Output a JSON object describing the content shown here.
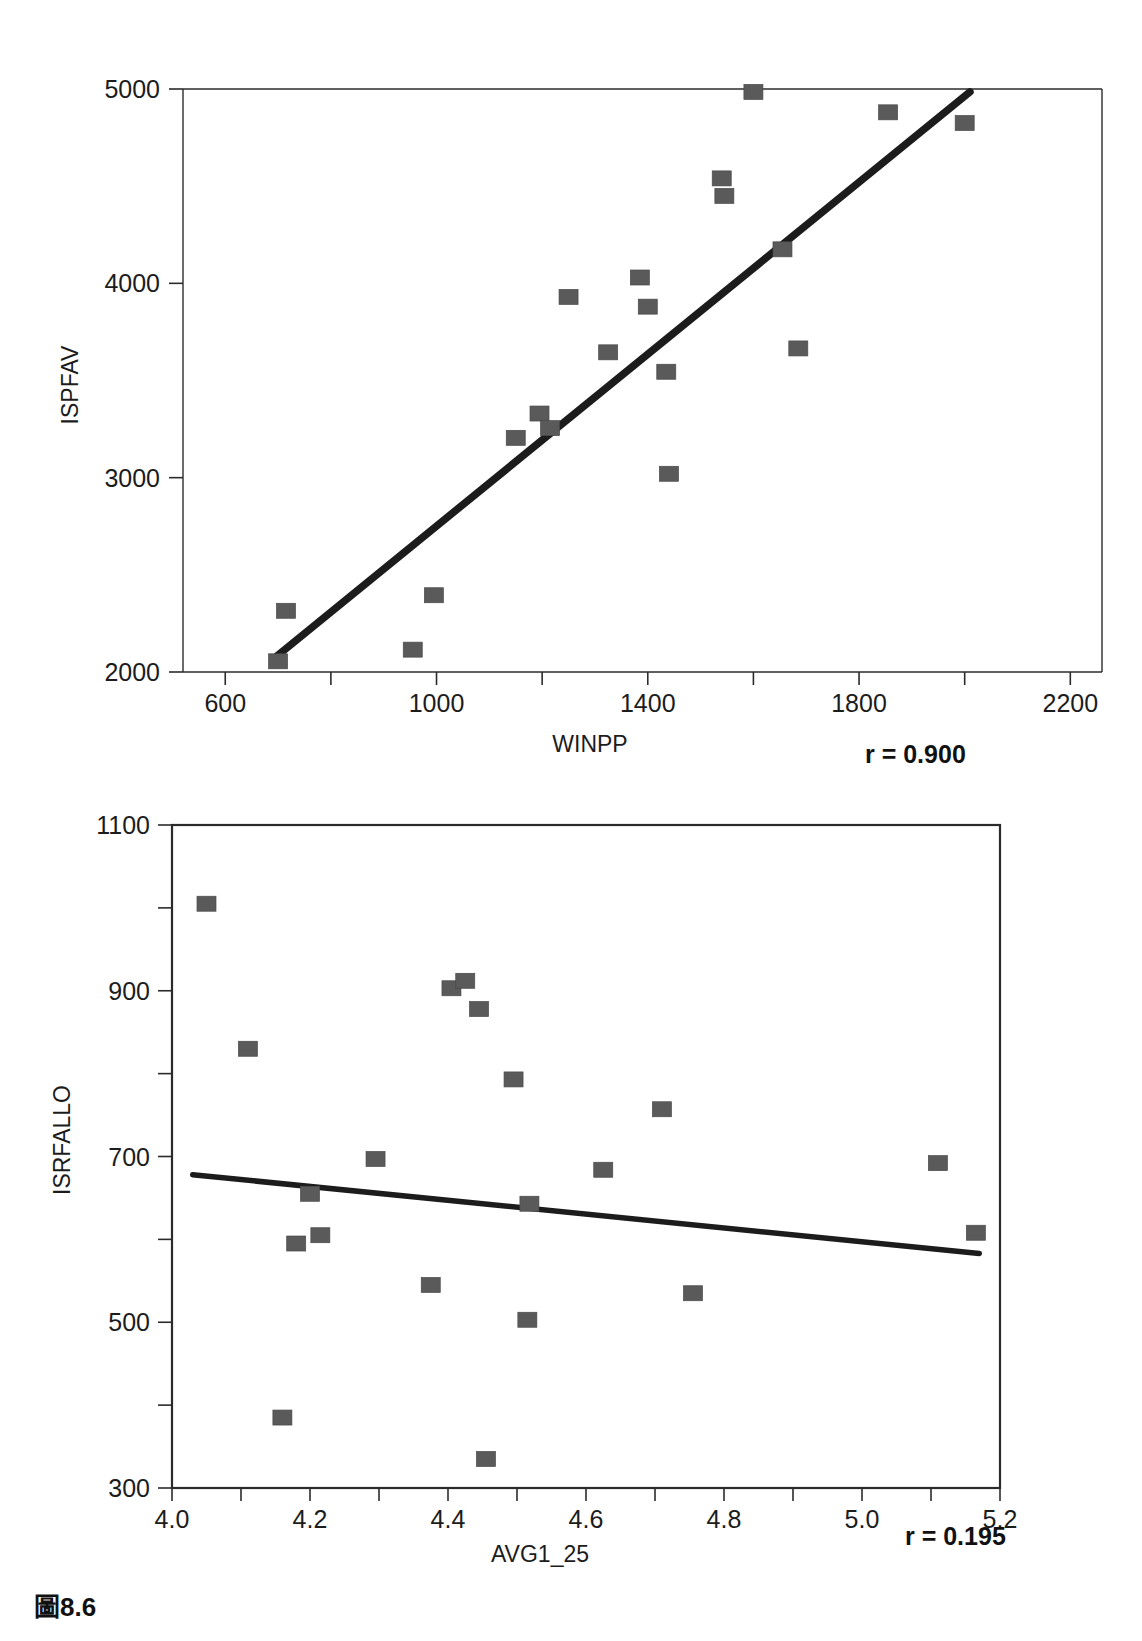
{
  "caption": "圖8.6",
  "chart_data": [
    {
      "id": "chart-1",
      "type": "scatter",
      "title": "",
      "xlabel": "WINPP",
      "ylabel": "ISPFAV",
      "xlim": [
        520,
        2260
      ],
      "ylim": [
        2000,
        5000
      ],
      "xticks": [
        600,
        1000,
        1400,
        1800,
        2200
      ],
      "xtick_labels": [
        "600",
        "1000",
        "1400",
        "1800",
        "2200"
      ],
      "xminor": [
        800,
        1200,
        1600,
        2000
      ],
      "yticks": [
        2000,
        3000,
        4000,
        5000
      ],
      "ytick_labels": [
        "2000",
        "3000",
        "4000",
        "5000"
      ],
      "grid": false,
      "annotation": "r = 0.900",
      "correlation": 0.9,
      "points": [
        {
          "x": 715,
          "y": 2315
        },
        {
          "x": 700,
          "y": 2055
        },
        {
          "x": 955,
          "y": 2115
        },
        {
          "x": 995,
          "y": 2395
        },
        {
          "x": 1150,
          "y": 3205
        },
        {
          "x": 1195,
          "y": 3330
        },
        {
          "x": 1215,
          "y": 3255
        },
        {
          "x": 1250,
          "y": 3930
        },
        {
          "x": 1325,
          "y": 3645
        },
        {
          "x": 1385,
          "y": 4030
        },
        {
          "x": 1400,
          "y": 3880
        },
        {
          "x": 1435,
          "y": 3545
        },
        {
          "x": 1440,
          "y": 3020
        },
        {
          "x": 1540,
          "y": 4540
        },
        {
          "x": 1545,
          "y": 4450
        },
        {
          "x": 1600,
          "y": 4985
        },
        {
          "x": 1655,
          "y": 4175
        },
        {
          "x": 1685,
          "y": 3665
        },
        {
          "x": 1855,
          "y": 4880
        },
        {
          "x": 2000,
          "y": 4825
        }
      ],
      "fit_line": {
        "x1": 690,
        "y1": 2065,
        "x2": 2010,
        "y2": 4985
      }
    },
    {
      "id": "chart-2",
      "type": "scatter",
      "title": "",
      "xlabel": "AVG1_25",
      "ylabel": "ISRFALLO",
      "xlim": [
        4.0,
        5.2
      ],
      "ylim": [
        300,
        1100
      ],
      "xticks": [
        4.0,
        4.2,
        4.4,
        4.6,
        4.8,
        5.0,
        5.2
      ],
      "xtick_labels": [
        "4.0",
        "4.2",
        "4.4",
        "4.6",
        "4.8",
        "5.0",
        "5.2"
      ],
      "xminor": [
        4.1,
        4.3,
        4.5,
        4.7,
        4.9,
        5.1
      ],
      "yticks": [
        300,
        500,
        700,
        900,
        1100
      ],
      "ytick_labels": [
        "300",
        "500",
        "700",
        "900",
        "1100"
      ],
      "yminor": [
        400,
        600,
        800,
        1000
      ],
      "grid": false,
      "annotation": "r = 0.195",
      "correlation": 0.195,
      "points": [
        {
          "x": 4.05,
          "y": 1005
        },
        {
          "x": 4.11,
          "y": 830
        },
        {
          "x": 4.16,
          "y": 385
        },
        {
          "x": 4.18,
          "y": 595
        },
        {
          "x": 4.2,
          "y": 655
        },
        {
          "x": 4.215,
          "y": 605
        },
        {
          "x": 4.295,
          "y": 697
        },
        {
          "x": 4.375,
          "y": 545
        },
        {
          "x": 4.405,
          "y": 903
        },
        {
          "x": 4.425,
          "y": 912
        },
        {
          "x": 4.445,
          "y": 878
        },
        {
          "x": 4.455,
          "y": 335
        },
        {
          "x": 4.495,
          "y": 793
        },
        {
          "x": 4.515,
          "y": 503
        },
        {
          "x": 4.518,
          "y": 643
        },
        {
          "x": 4.625,
          "y": 684
        },
        {
          "x": 4.71,
          "y": 757
        },
        {
          "x": 4.755,
          "y": 535
        },
        {
          "x": 5.11,
          "y": 692
        },
        {
          "x": 5.165,
          "y": 608
        }
      ],
      "fit_line": {
        "x1": 4.03,
        "y1": 678,
        "x2": 5.17,
        "y2": 583
      }
    }
  ]
}
